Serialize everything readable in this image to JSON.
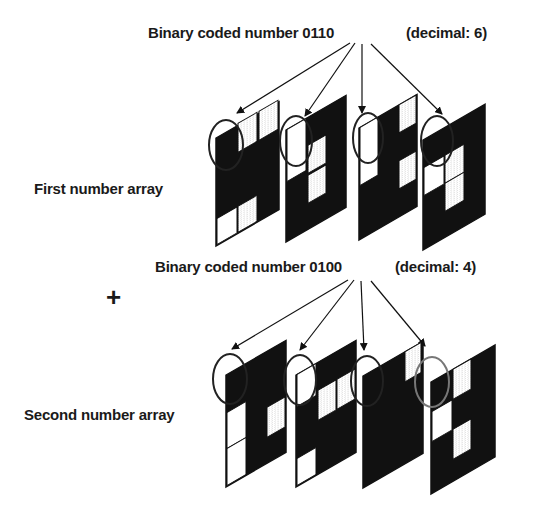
{
  "diagram": {
    "first": {
      "binary_label": "Binary coded number 0110",
      "decimal_label": "(decimal: 6)",
      "array_label": "First number array",
      "bits": [
        "0",
        "1",
        "1",
        "0"
      ]
    },
    "operator": "+",
    "second": {
      "binary_label": "Binary coded number 0100",
      "decimal_label": "(decimal: 4)",
      "array_label": "Second number array",
      "bits": [
        "0",
        "1",
        "0",
        "0"
      ]
    },
    "cell_legend": {
      "B": "black",
      "W": "white",
      "H": "hatched"
    },
    "colors": {
      "ink": "#111111",
      "paper": "#ffffff",
      "hatch": "#bdbdbd"
    }
  }
}
